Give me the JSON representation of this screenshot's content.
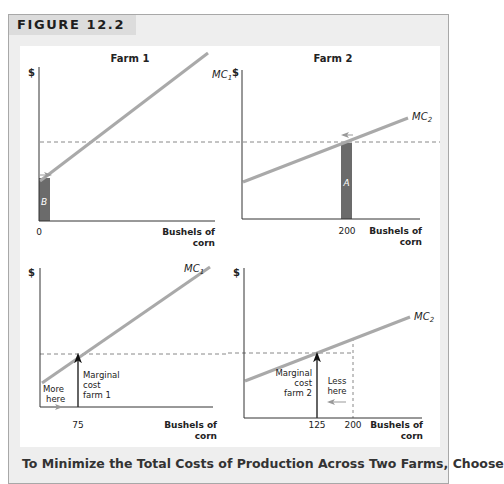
{
  "figure": {
    "label": "FIGURE 12.2",
    "caption": "To Minimize the Total Costs of Production Across Two Farms, Choose"
  },
  "colors": {
    "curve": "#a9a9a9",
    "bar": "#6b6b6b",
    "axis": "#333333",
    "dashed": "#888888",
    "frame_bg": "#eeeeee",
    "tab_bg": "#dcdcdc"
  },
  "panels": {
    "top_left": {
      "title": "Farm 1",
      "y_label": "$",
      "curve_label": "MC",
      "curve_sub": "1",
      "x_tick": "0",
      "x_label_1": "Bushels of",
      "x_label_2": "corn",
      "bar_label": "B"
    },
    "top_right": {
      "title": "Farm 2",
      "y_label": "$",
      "curve_label": "MC",
      "curve_sub": "2",
      "x_tick": "200",
      "x_label_1": "Bushels of",
      "x_label_2": "corn",
      "bar_label": "A"
    },
    "bottom_left": {
      "y_label": "$",
      "curve_label": "MC",
      "curve_sub": "1",
      "x_tick": "75",
      "x_label_1": "Bushels of",
      "x_label_2": "corn",
      "annot_mc_1": "Marginal",
      "annot_mc_2": "cost",
      "annot_mc_3": "farm 1",
      "annot_more_1": "More",
      "annot_more_2": "here"
    },
    "bottom_right": {
      "y_label": "$",
      "curve_label": "MC",
      "curve_sub": "2",
      "x_tick_1": "125",
      "x_tick_2": "200",
      "x_label_1": "Bushels of",
      "x_label_2": "corn",
      "annot_mc_1": "Marginal",
      "annot_mc_2": "cost",
      "annot_mc_3": "farm 2",
      "annot_less_1": "Less",
      "annot_less_2": "here"
    }
  }
}
